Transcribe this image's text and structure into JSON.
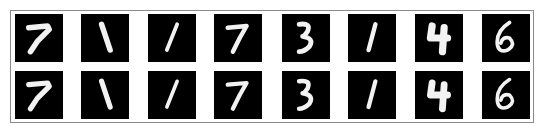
{
  "figure": {
    "rows": [
      {
        "name": "original",
        "digits": [
          "7",
          "1",
          "1",
          "7",
          "3",
          "1",
          "4",
          "6"
        ]
      },
      {
        "name": "reconstructed",
        "digits": [
          "7",
          "1",
          "1",
          "7",
          "3",
          "1",
          "4",
          "6"
        ]
      }
    ],
    "tile_background": "#000000",
    "stroke_color": "#f2f2f2",
    "frame_color": "#8a8a8a"
  }
}
